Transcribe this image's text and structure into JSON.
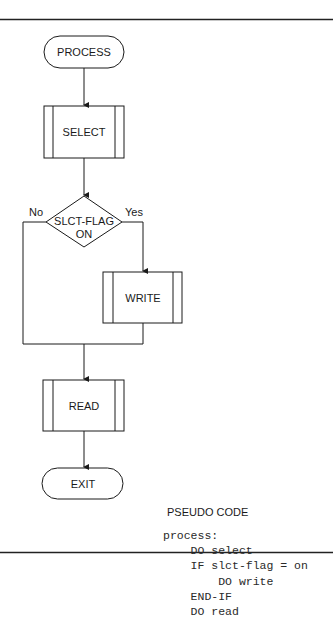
{
  "diagram": {
    "type": "flowchart",
    "nodes": {
      "start": {
        "shape": "terminator",
        "label": "PROCESS"
      },
      "select": {
        "shape": "predefined-process",
        "label": "SELECT"
      },
      "decision": {
        "shape": "decision",
        "label_line1": "SLCT-FLAG",
        "label_line2": "ON"
      },
      "write": {
        "shape": "predefined-process",
        "label": "WRITE"
      },
      "read": {
        "shape": "predefined-process",
        "label": "READ"
      },
      "end": {
        "shape": "terminator",
        "label": "EXIT"
      }
    },
    "branches": {
      "no": "No",
      "yes": "Yes"
    },
    "edges": [
      [
        "PROCESS",
        "SELECT"
      ],
      [
        "SELECT",
        "SLCT-FLAG ON"
      ],
      [
        "SLCT-FLAG ON",
        "WRITE",
        "Yes"
      ],
      [
        "SLCT-FLAG ON",
        "READ",
        "No"
      ],
      [
        "WRITE",
        "READ"
      ],
      [
        "READ",
        "EXIT"
      ]
    ]
  },
  "pseudocode": {
    "title": "PSEUDO CODE",
    "lines": [
      "process:",
      "    DO select",
      "    IF slct-flag = on",
      "        DO write",
      "    END-IF",
      "    DO read"
    ]
  }
}
